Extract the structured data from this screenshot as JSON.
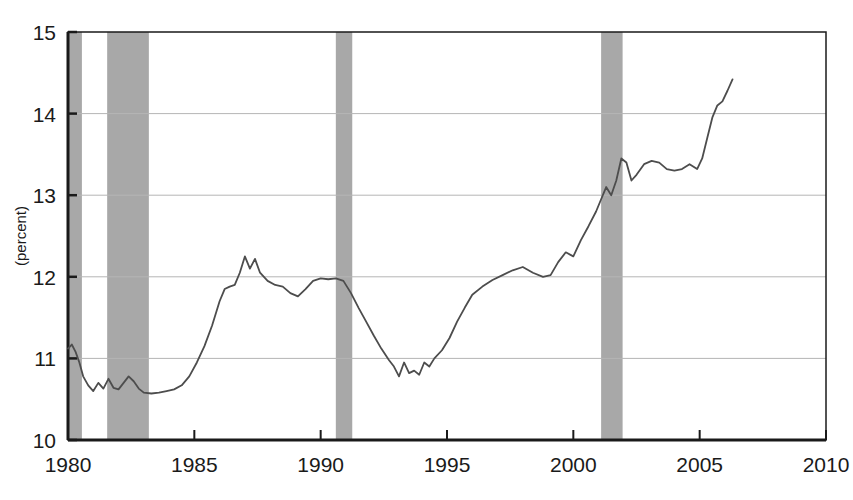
{
  "chart_data": {
    "type": "line",
    "title": "",
    "subtitle": "",
    "xlabel": "",
    "ylabel": "(percent)",
    "xlim": [
      1980,
      2010
    ],
    "ylim": [
      10,
      15
    ],
    "xticks": [
      1980,
      1985,
      1990,
      1995,
      2000,
      2005,
      2010
    ],
    "xtick_labels": [
      "1980",
      "1985",
      "1990",
      "1995",
      "2000",
      "2005",
      "2010"
    ],
    "yticks": [
      10,
      11,
      12,
      13,
      14,
      15
    ],
    "ytick_labels": [
      "10",
      "11",
      "12",
      "13",
      "14",
      "15"
    ],
    "grid": true,
    "grid_axis": "y",
    "legend": null,
    "legend_position": "none",
    "line_color": "#4d4d4d",
    "grid_color": "#b5b5b5",
    "axis_color": "#1a1a1a",
    "shaded_band_color": "#a8a8a8",
    "shaded_bands": [
      {
        "label": "recession",
        "start": 1980.0,
        "end": 1980.55
      },
      {
        "label": "recession",
        "start": 1981.55,
        "end": 1983.2
      },
      {
        "label": "recession",
        "start": 1990.6,
        "end": 1991.25
      },
      {
        "label": "recession",
        "start": 2001.1,
        "end": 2001.95
      }
    ],
    "series": [
      {
        "name": "percent",
        "x": [
          1980.0,
          1980.15,
          1980.3,
          1980.45,
          1980.6,
          1980.8,
          1981.0,
          1981.2,
          1981.4,
          1981.6,
          1981.8,
          1982.0,
          1982.2,
          1982.4,
          1982.6,
          1982.8,
          1983.0,
          1983.3,
          1983.6,
          1983.9,
          1984.2,
          1984.5,
          1984.8,
          1985.1,
          1985.4,
          1985.7,
          1986.0,
          1986.2,
          1986.4,
          1986.6,
          1986.8,
          1987.0,
          1987.2,
          1987.4,
          1987.6,
          1987.9,
          1988.2,
          1988.5,
          1988.8,
          1989.1,
          1989.4,
          1989.7,
          1990.0,
          1990.3,
          1990.6,
          1990.9,
          1991.2,
          1991.5,
          1991.8,
          1992.1,
          1992.4,
          1992.7,
          1992.9,
          1993.1,
          1993.3,
          1993.5,
          1993.7,
          1993.9,
          1994.1,
          1994.3,
          1994.5,
          1994.8,
          1995.1,
          1995.4,
          1995.7,
          1996.0,
          1996.4,
          1996.8,
          1997.2,
          1997.6,
          1998.0,
          1998.4,
          1998.8,
          1999.1,
          1999.4,
          1999.7,
          2000.0,
          2000.3,
          2000.6,
          2000.9,
          2001.1,
          2001.3,
          2001.5,
          2001.7,
          2001.9,
          2002.1,
          2002.3,
          2002.5,
          2002.8,
          2003.1,
          2003.4,
          2003.7,
          2004.0,
          2004.3,
          2004.6,
          2004.9,
          2005.1,
          2005.3,
          2005.5,
          2005.7,
          2005.9,
          2006.1,
          2006.3
        ],
        "y": [
          11.12,
          11.17,
          11.08,
          10.95,
          10.78,
          10.67,
          10.6,
          10.7,
          10.63,
          10.75,
          10.64,
          10.62,
          10.7,
          10.78,
          10.72,
          10.63,
          10.58,
          10.57,
          10.58,
          10.6,
          10.62,
          10.67,
          10.78,
          10.95,
          11.15,
          11.4,
          11.7,
          11.85,
          11.88,
          11.9,
          12.05,
          12.25,
          12.1,
          12.22,
          12.05,
          11.95,
          11.9,
          11.88,
          11.8,
          11.76,
          11.85,
          11.95,
          11.98,
          11.97,
          11.98,
          11.95,
          11.8,
          11.62,
          11.45,
          11.28,
          11.12,
          10.98,
          10.9,
          10.78,
          10.95,
          10.82,
          10.85,
          10.8,
          10.95,
          10.9,
          11.0,
          11.1,
          11.25,
          11.45,
          11.62,
          11.78,
          11.88,
          11.96,
          12.02,
          12.08,
          12.12,
          12.05,
          12.0,
          12.02,
          12.18,
          12.3,
          12.25,
          12.45,
          12.62,
          12.8,
          12.95,
          13.1,
          13.0,
          13.18,
          13.45,
          13.4,
          13.18,
          13.25,
          13.38,
          13.42,
          13.4,
          13.32,
          13.3,
          13.32,
          13.38,
          13.32,
          13.45,
          13.7,
          13.95,
          14.1,
          14.15,
          14.28,
          14.42
        ]
      }
    ]
  },
  "layout": {
    "plot_left": 68,
    "plot_right": 826,
    "plot_top": 32,
    "plot_bottom": 440
  }
}
